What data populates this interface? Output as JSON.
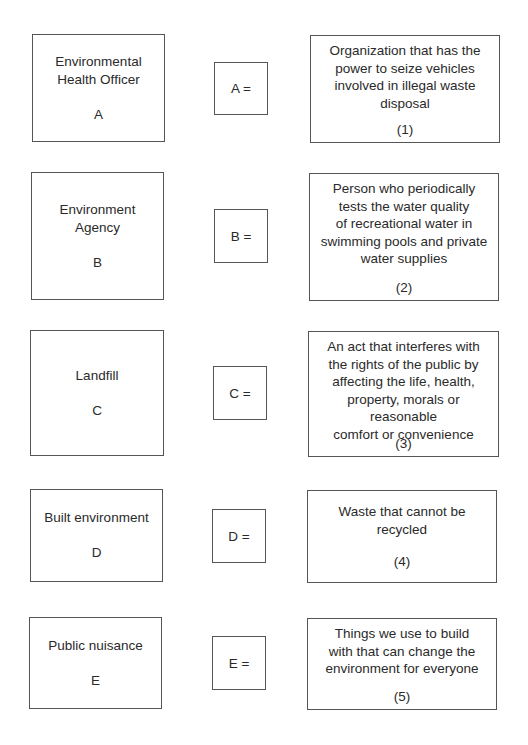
{
  "rows": [
    {
      "term": "Environmental Health Officer",
      "term_lines": [
        "Environmental",
        "Health Officer"
      ],
      "letter": "A",
      "match_label": "A =",
      "definition": "Organization that has the power to seize vehicles involved in illegal waste disposal",
      "definition_lines": [
        "Organization that has the",
        "power to seize vehicles",
        "involved in illegal waste",
        "disposal"
      ],
      "number": "(1)"
    },
    {
      "term": "Environment Agency",
      "term_lines": [
        "Environment",
        "Agency"
      ],
      "letter": "B",
      "match_label": "B =",
      "definition": "Person who periodically tests the water quality of recreational water in swimming pools and private water supplies",
      "definition_lines": [
        "Person who periodically",
        "tests the water quality",
        "of recreational water in",
        "swimming pools and private",
        "water supplies"
      ],
      "number": "(2)"
    },
    {
      "term": "Landfill",
      "term_lines": [
        "Landfill"
      ],
      "letter": "C",
      "match_label": "C =",
      "definition": "An act that interferes with the rights of the public by affecting the life, health, property, morals or reasonable comfort or convenience",
      "definition_lines": [
        "An act that interferes with",
        "the rights of the public by",
        "affecting the life, health,",
        "property, morals or reasonable",
        "comfort or convenience"
      ],
      "number": "(3)"
    },
    {
      "term": "Built environment",
      "term_lines": [
        "Built environment"
      ],
      "letter": "D",
      "match_label": "D =",
      "definition": "Waste that cannot be recycled",
      "definition_lines": [
        "Waste that cannot be",
        "recycled"
      ],
      "number": "(4)"
    },
    {
      "term": "Public nuisance",
      "term_lines": [
        "Public nuisance"
      ],
      "letter": "E",
      "match_label": "E =",
      "definition": "Things we use to build with that can change the environment for everyone",
      "definition_lines": [
        "Things we use to build",
        "with that can change the",
        "environment for everyone"
      ],
      "number": "(5)"
    }
  ]
}
